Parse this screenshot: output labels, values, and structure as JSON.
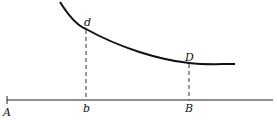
{
  "diagram": {
    "type": "curve-over-axis",
    "labels": {
      "axis_start": "A",
      "foot_left": "b",
      "foot_right": "B",
      "curve_point_left": "d",
      "curve_point_right": "D"
    },
    "colors": {
      "line": "#111111",
      "background": "#ffffff"
    }
  }
}
